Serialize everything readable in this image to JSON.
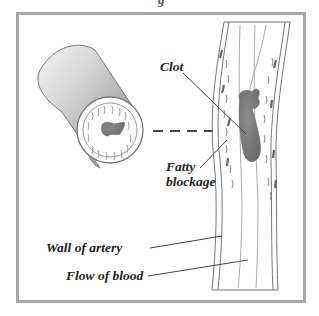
{
  "diagram": {
    "top_text_fragment": "g",
    "labels": {
      "clot": "Clot",
      "fatty_blockage_line1": "Fatty",
      "fatty_blockage_line2": "blockage",
      "wall_of_artery": "Wall of artery",
      "flow_of_blood": "Flow of blood"
    },
    "parts": [
      {
        "name": "cross-section",
        "description": "Cylindrical cut of artery showing clot in lumen"
      },
      {
        "name": "longitudinal-view",
        "description": "Vertical artery with fatty deposits and dark clot"
      },
      {
        "name": "dashed-connector",
        "description": "Dashed line linking cross-section to artery"
      }
    ],
    "colors": {
      "frame": "#a8a8a8",
      "clot": "#7a7a7a",
      "text": "#222222",
      "line": "#555555"
    }
  }
}
